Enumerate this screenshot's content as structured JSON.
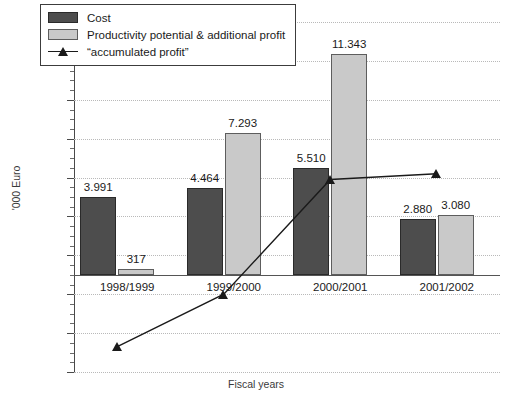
{
  "chart_data": {
    "type": "bar",
    "title": "",
    "xlabel": "Fiscal years",
    "ylabel": "'000 Euro",
    "categories": [
      "1998/1999",
      "1999/2000",
      "2000/2001",
      "2001/2002"
    ],
    "ylim": [
      -5000,
      13000
    ],
    "yticks": [
      13000,
      11000,
      9000,
      7000,
      5000,
      3000,
      1000,
      -1000,
      -3000,
      -5000
    ],
    "ytick_labels": [
      "13.000",
      "11.000",
      "9.000",
      "7.000",
      "5.000",
      "3.000",
      "1.000",
      "-1.000",
      "-3.000",
      "-5.000"
    ],
    "grid": true,
    "legend_position": "top-left",
    "series": [
      {
        "name": "Cost",
        "type": "bar",
        "color": "#4d4d4d",
        "values": [
          3991,
          4464,
          5510,
          2880
        ],
        "labels": [
          "3.991",
          "4.464",
          "5.510",
          "2.880"
        ]
      },
      {
        "name": "Productivity potential & additional profit",
        "type": "bar",
        "color": "#c9c9c9",
        "values": [
          317,
          7293,
          11343,
          3080
        ],
        "labels": [
          "317",
          "7.293",
          "11.343",
          "3.080"
        ]
      },
      {
        "name": "“accumulated profit”",
        "type": "line",
        "color": "#1a1a1a",
        "marker": "triangle-up",
        "values": [
          -3700,
          -1000,
          4900,
          5200
        ],
        "labels": [
          "",
          "",
          "",
          ""
        ]
      }
    ]
  },
  "legend": {
    "items": [
      {
        "label": "Cost",
        "swatch": "cost"
      },
      {
        "label": "Productivity potential & additional profit",
        "swatch": "prod"
      },
      {
        "label": "“accumulated profit”",
        "swatch": "line"
      }
    ]
  },
  "axes": {
    "y_title": "'000 Euro",
    "x_title": "Fiscal years"
  }
}
